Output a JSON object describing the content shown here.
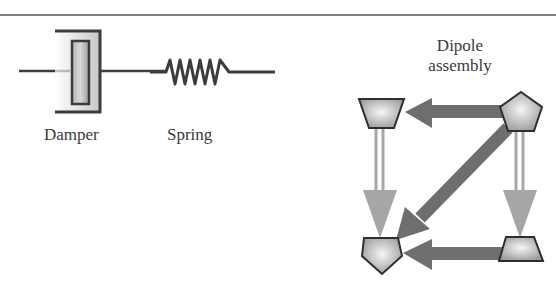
{
  "figure": {
    "top_rule": true,
    "labels": {
      "damper": "Damper",
      "spring": "Spring",
      "dipole_line1": "Dipole",
      "dipole_line2": "assembly"
    },
    "components": [
      {
        "id": "damper",
        "type": "dashpot"
      },
      {
        "id": "spring",
        "type": "coil-spring",
        "coils": 6
      },
      {
        "id": "dipole-assembly",
        "nodes": [
          {
            "id": "top-left",
            "shape": "trapezoid-inverted"
          },
          {
            "id": "top-right",
            "shape": "pentagon"
          },
          {
            "id": "bottom-left",
            "shape": "pentagon"
          },
          {
            "id": "bottom-right",
            "shape": "trapezoid"
          }
        ],
        "arrows": [
          {
            "from": "top-right",
            "to": "top-left",
            "style": "thick-dark"
          },
          {
            "from": "top-right",
            "to": "bottom-left",
            "style": "thick-dark"
          },
          {
            "from": "bottom-right",
            "to": "bottom-left",
            "style": "thick-dark"
          },
          {
            "from": "top-left",
            "to": "bottom-left",
            "style": "double-light"
          },
          {
            "from": "top-right",
            "to": "bottom-right",
            "style": "double-light"
          }
        ]
      }
    ],
    "colors": {
      "line": "#3c3c3c",
      "arrow_dark": "#6e6e6e",
      "arrow_light": "#a6a6a6",
      "node_fill_center": "#f4f4f4",
      "node_fill_edge": "#9a9a9a",
      "text": "#3a3a3a"
    }
  }
}
